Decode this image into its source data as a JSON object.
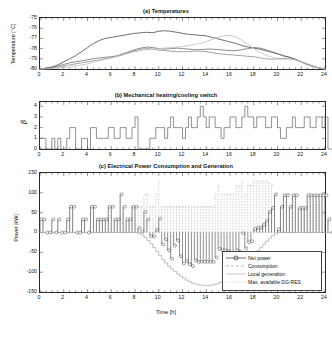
{
  "figure": {
    "width": 332,
    "height": 341,
    "background": "#ffffff"
  },
  "chart_data": [
    {
      "id": "panel-a",
      "type": "line",
      "title": "(a) Temperatures",
      "xlabel": "",
      "ylabel": "Temperature [°C]",
      "xlim": [
        0,
        24
      ],
      "ylim": [
        -80,
        -75
      ],
      "xticks": [
        0,
        2,
        4,
        6,
        8,
        10,
        12,
        14,
        16,
        18,
        20,
        22,
        24
      ],
      "yticks": [
        -75,
        -76,
        -77,
        -78,
        -79,
        -80
      ],
      "ytick_labels": [
        "-75",
        "-76",
        "-77",
        "-78",
        "-79",
        "-80"
      ],
      "xtick_labels": [
        "0",
        "2",
        "4",
        "6",
        "8",
        "10",
        "12",
        "14",
        "16",
        "18",
        "20",
        "22",
        "24"
      ],
      "grid": false,
      "legend": "none",
      "x": [
        0,
        0.5,
        1,
        1.5,
        2,
        2.5,
        3,
        3.5,
        4,
        4.5,
        5,
        5.5,
        6,
        6.5,
        7,
        7.5,
        8,
        8.5,
        9,
        9.5,
        10,
        10.5,
        11,
        11.5,
        12,
        12.5,
        13,
        13.5,
        14,
        14.5,
        15,
        15.5,
        16,
        16.5,
        17,
        17.5,
        18,
        18.5,
        19,
        19.5,
        20,
        20.5,
        21,
        21.5,
        22,
        22.5,
        23,
        23.5,
        24
      ],
      "series": [
        {
          "name": "zone-1",
          "color": "#4a4a4a",
          "values": [
            -80,
            -79.9,
            -79.8,
            -79.6,
            -79.3,
            -79.0,
            -78.7,
            -78.3,
            -77.9,
            -77.5,
            -77.2,
            -77.0,
            -76.9,
            -76.8,
            -76.7,
            -76.6,
            -76.5,
            -76.45,
            -76.4,
            -76.45,
            -76.3,
            -76.25,
            -76.3,
            -76.4,
            -76.5,
            -76.6,
            -76.65,
            -76.7,
            -76.75,
            -76.9,
            -77.05,
            -77.2,
            -77.35,
            -77.5,
            -77.7,
            -77.85,
            -77.95,
            -78.05,
            -78.2,
            -78.35,
            -78.5,
            -78.7,
            -78.85,
            -79.05,
            -79.3,
            -79.55,
            -79.75,
            -79.9,
            -80
          ]
        },
        {
          "name": "zone-2",
          "color": "#6e6e6e",
          "values": [
            -80,
            -79.95,
            -79.85,
            -79.7,
            -79.55,
            -79.4,
            -79.3,
            -79.2,
            -79.1,
            -79.0,
            -78.9,
            -78.85,
            -78.8,
            -78.7,
            -78.5,
            -78.3,
            -78.1,
            -77.95,
            -77.85,
            -77.9,
            -78.0,
            -78.05,
            -78.0,
            -77.95,
            -78.0,
            -78.05,
            -78.1,
            -78.1,
            -78.05,
            -78.05,
            -78.1,
            -78.15,
            -78.2,
            -78.2,
            -78.1,
            -78.0,
            -77.9,
            -77.95,
            -78.1,
            -78.3,
            -78.5,
            -78.7,
            -78.85,
            -79.05,
            -79.3,
            -79.55,
            -79.75,
            -79.9,
            -80
          ]
        },
        {
          "name": "zone-3",
          "color": "#8c8c8c",
          "values": [
            -80,
            -79.95,
            -79.9,
            -79.8,
            -79.7,
            -79.6,
            -79.5,
            -79.4,
            -79.3,
            -79.2,
            -79.1,
            -79.0,
            -78.9,
            -78.75,
            -78.6,
            -78.4,
            -78.2,
            -78.05,
            -78.0,
            -78.05,
            -78.15,
            -78.2,
            -78.25,
            -78.3,
            -78.3,
            -78.3,
            -78.25,
            -78.25,
            -78.3,
            -78.4,
            -78.5,
            -78.55,
            -78.6,
            -78.65,
            -78.7,
            -78.75,
            -78.8,
            -78.9,
            -79.0,
            -79.05,
            -79.0,
            -78.95,
            -79.0,
            -79.1,
            -79.3,
            -79.5,
            -79.7,
            -79.9,
            -80
          ]
        },
        {
          "name": "zone-4",
          "color": "#bdbdbd",
          "values": [
            -80,
            -79.98,
            -79.95,
            -79.9,
            -79.85,
            -79.8,
            -79.7,
            -79.6,
            -79.5,
            -79.35,
            -79.2,
            -79.05,
            -78.9,
            -78.75,
            -78.6,
            -78.45,
            -78.3,
            -78.2,
            -78.1,
            -78.05,
            -78.0,
            -77.95,
            -77.9,
            -77.85,
            -77.8,
            -77.7,
            -77.6,
            -77.5,
            -77.3,
            -77.1,
            -76.9,
            -76.75,
            -76.7,
            -76.85,
            -77.2,
            -77.6,
            -78.0,
            -78.35,
            -78.65,
            -78.85,
            -79.0,
            -79.05,
            -79.0,
            -79.1,
            -79.3,
            -79.55,
            -79.75,
            -79.9,
            -80
          ]
        }
      ]
    },
    {
      "id": "panel-b",
      "type": "line",
      "title": "(b) Mechanical heating/cooling switch",
      "xlabel": "",
      "ylabel": "β",
      "xlim": [
        0,
        24
      ],
      "ylim": [
        0,
        4.4
      ],
      "xticks": [
        0,
        2,
        4,
        6,
        8,
        10,
        12,
        14,
        16,
        18,
        20,
        22,
        24
      ],
      "yticks": [
        0,
        1,
        2,
        3,
        4
      ],
      "ytick_labels": [
        "0",
        "1",
        "2",
        "3",
        "4"
      ],
      "xtick_labels": [
        "0",
        "2",
        "4",
        "6",
        "8",
        "10",
        "12",
        "14",
        "16",
        "18",
        "20",
        "22",
        "24"
      ],
      "grid": false,
      "legend": "none",
      "step_color": "#555555",
      "step_dt": 0.25,
      "values": [
        1,
        1,
        0,
        0,
        1,
        0,
        1,
        0,
        0,
        1,
        2,
        2,
        0,
        0,
        1,
        1,
        0,
        2,
        2,
        1,
        1,
        1,
        1,
        2,
        2,
        1,
        1,
        2,
        2,
        1,
        1,
        2,
        3,
        0,
        0,
        0,
        0,
        1,
        1,
        2,
        2,
        2,
        1,
        2,
        3,
        2,
        2,
        2,
        1,
        2,
        3,
        2,
        2,
        3,
        4,
        3,
        2,
        3,
        3,
        2,
        2,
        1,
        2,
        2,
        3,
        3,
        2,
        2,
        3,
        4,
        3,
        3,
        2,
        3,
        3,
        3,
        2,
        2,
        3,
        3,
        2,
        1,
        1,
        2,
        2,
        3,
        2,
        2,
        2,
        3,
        3,
        2,
        2,
        3,
        3,
        2,
        3,
        0,
        0,
        0
      ]
    },
    {
      "id": "panel-c",
      "type": "line",
      "title": "(c) Electrical Power Consumption and Generation",
      "xlabel": "Time [h]",
      "ylabel": "Power [kW]",
      "xlim": [
        0,
        24
      ],
      "ylim": [
        -150,
        150
      ],
      "xticks": [
        0,
        2,
        4,
        6,
        8,
        10,
        12,
        14,
        16,
        18,
        20,
        22,
        24
      ],
      "yticks": [
        150,
        100,
        50,
        0,
        -50,
        -100,
        -150
      ],
      "ytick_labels": [
        "150",
        "100",
        "50",
        "0",
        "-50",
        "-100",
        "-150"
      ],
      "xtick_labels": [
        "0",
        "2",
        "4",
        "6",
        "8",
        "10",
        "12",
        "14",
        "16",
        "18",
        "20",
        "22",
        "24"
      ],
      "grid": false,
      "legend": "inside-bottom-right",
      "legend_entries": [
        {
          "label": "Net power",
          "color": "#333333",
          "style": "stem-marker"
        },
        {
          "label": "Consumption",
          "color": "#9a9a9a",
          "style": "dashed"
        },
        {
          "label": "Local generation",
          "color": "#b0b0b0",
          "style": "solid"
        },
        {
          "label": "Max. available DG-RES",
          "color": "#c4c4c4",
          "style": "dotted"
        }
      ],
      "series": [
        {
          "name": "Net power",
          "color": "#333333",
          "style": "stem-marker",
          "dt": 0.25,
          "values": [
            33,
            33,
            0,
            0,
            33,
            0,
            33,
            0,
            0,
            33,
            65,
            65,
            0,
            0,
            33,
            33,
            0,
            65,
            65,
            33,
            33,
            33,
            33,
            65,
            65,
            33,
            33,
            96,
            65,
            33,
            33,
            65,
            65,
            11,
            2,
            52,
            33,
            -10,
            -10,
            7,
            35,
            -30,
            -18,
            -45,
            -66,
            -33,
            -20,
            -60,
            -78,
            -72,
            -80,
            -85,
            -70,
            -74,
            -74,
            -74,
            -74,
            -74,
            -74,
            -63,
            -41,
            -45,
            -45,
            -47,
            -70,
            -70,
            -45,
            -48,
            -2,
            -40,
            -25,
            -22,
            9,
            12,
            12,
            20,
            30,
            52,
            62,
            96,
            8,
            65,
            94,
            94,
            65,
            94,
            94,
            62,
            62,
            62,
            94,
            94,
            94,
            94,
            94,
            94,
            94,
            33,
            0,
            65
          ]
        },
        {
          "name": "Consumption",
          "color": "#9a9a9a",
          "style": "dashed",
          "dt": 0.25,
          "values": [
            33,
            33,
            0,
            0,
            33,
            0,
            33,
            0,
            0,
            33,
            65,
            65,
            0,
            0,
            33,
            33,
            0,
            65,
            65,
            33,
            33,
            33,
            33,
            65,
            65,
            33,
            33,
            96,
            65,
            33,
            33,
            65,
            65,
            65,
            65,
            96,
            96,
            65,
            65,
            96,
            130,
            65,
            65,
            65,
            65,
            65,
            65,
            65,
            65,
            65,
            65,
            65,
            65,
            65,
            65,
            65,
            65,
            65,
            65,
            96,
            118,
            96,
            96,
            96,
            96,
            96,
            118,
            118,
            130,
            96,
            118,
            118,
            130,
            130,
            130,
            130,
            130,
            125,
            120,
            96,
            8,
            65,
            94,
            94,
            65,
            94,
            94,
            62,
            62,
            62,
            94,
            94,
            94,
            94,
            94,
            94,
            94,
            33,
            0,
            65
          ]
        },
        {
          "name": "Local generation",
          "color": "#b0b0b0",
          "style": "solid",
          "dt": 0.25,
          "values": [
            0,
            0,
            0,
            0,
            0,
            0,
            0,
            0,
            0,
            0,
            0,
            0,
            0,
            0,
            0,
            0,
            0,
            0,
            0,
            0,
            0,
            0,
            0,
            0,
            0,
            0,
            0,
            0,
            0,
            0,
            0,
            0,
            0,
            -2,
            -6,
            -12,
            -20,
            -28,
            -38,
            -48,
            -58,
            -68,
            -77,
            -85,
            -92,
            -98,
            -104,
            -110,
            -115,
            -120,
            -124,
            -128,
            -130,
            -132,
            -133,
            -134,
            -134,
            -133,
            -132,
            -130,
            -127,
            -124,
            -120,
            -115,
            -110,
            -104,
            -98,
            -92,
            -85,
            -78,
            -70,
            -62,
            -54,
            -46,
            -38,
            -30,
            -22,
            -14,
            -8,
            -3,
            0,
            0,
            0,
            0,
            0,
            0,
            0,
            0,
            0,
            0,
            0,
            0,
            0,
            0,
            0,
            0,
            0,
            0,
            0,
            0
          ]
        },
        {
          "name": "Max. available DG-RES",
          "color": "#c4c4c4",
          "style": "dotted",
          "dt": 0.25,
          "values": [
            0,
            0,
            0,
            0,
            0,
            0,
            0,
            0,
            0,
            0,
            0,
            0,
            0,
            0,
            0,
            0,
            0,
            0,
            0,
            0,
            0,
            0,
            0,
            0,
            0,
            0,
            0,
            0,
            0,
            0,
            0,
            0,
            0,
            -2,
            -6,
            -12,
            -20,
            -28,
            -38,
            -48,
            -58,
            -68,
            -77,
            -85,
            -92,
            -98,
            -104,
            -110,
            -115,
            -120,
            -124,
            -128,
            -130,
            -132,
            -133,
            -134,
            -134,
            -133,
            -132,
            -130,
            -127,
            -124,
            -120,
            -115,
            -110,
            -104,
            -98,
            -92,
            -85,
            -78,
            -70,
            -62,
            -54,
            -46,
            -38,
            -30,
            -22,
            -14,
            -8,
            -3,
            0,
            0,
            0,
            0,
            0,
            0,
            0,
            0,
            0,
            0,
            0,
            0,
            0,
            0,
            0,
            0,
            0,
            0,
            0,
            0
          ]
        }
      ]
    }
  ]
}
